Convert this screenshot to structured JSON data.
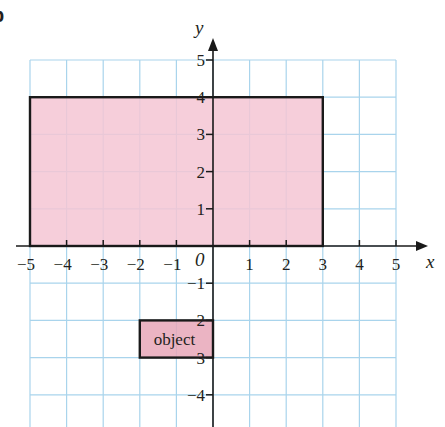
{
  "part_label": "b",
  "axes": {
    "x_label": "x",
    "y_label": "y",
    "origin_label": "0",
    "x_ticks": [
      -5,
      -4,
      -3,
      -2,
      -1,
      1,
      2,
      3,
      4,
      5
    ],
    "x_tick_labels": [
      "−5",
      "−4",
      "−3",
      "−2",
      "−1",
      "1",
      "2",
      "3",
      "4",
      "5"
    ],
    "y_ticks": [
      5,
      4,
      3,
      2,
      1,
      -1,
      -2,
      -3,
      -4
    ],
    "y_tick_labels": [
      "5",
      "4",
      "3",
      "2",
      "1",
      "−1",
      "2",
      "3",
      "−4"
    ],
    "x_range": [
      -5,
      5
    ],
    "y_range": [
      -4.9,
      5
    ]
  },
  "shapes": {
    "large_rectangle": {
      "x1": -5,
      "y1": 0,
      "x2": 3,
      "y2": 4,
      "fill": "#f4c6d3",
      "stroke": "#1a1a1a"
    },
    "object_rectangle": {
      "x1": -2,
      "y1": -3,
      "x2": 0,
      "y2": -2,
      "fill": "#e8a7b8",
      "stroke": "#1a1a1a",
      "label": "object"
    }
  },
  "colors": {
    "grid": "#a9d4ec",
    "axis": "#1a1a1a"
  }
}
